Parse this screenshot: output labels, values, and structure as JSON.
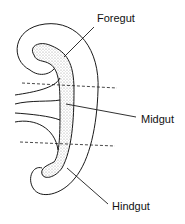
{
  "diagram": {
    "labels": {
      "foregut": "Foregut",
      "midgut": "Midgut",
      "hindgut": "Hindgut"
    },
    "colors": {
      "line": "#1a1a1a",
      "stipple": "#bdbdbd",
      "background": "#ffffff"
    }
  }
}
